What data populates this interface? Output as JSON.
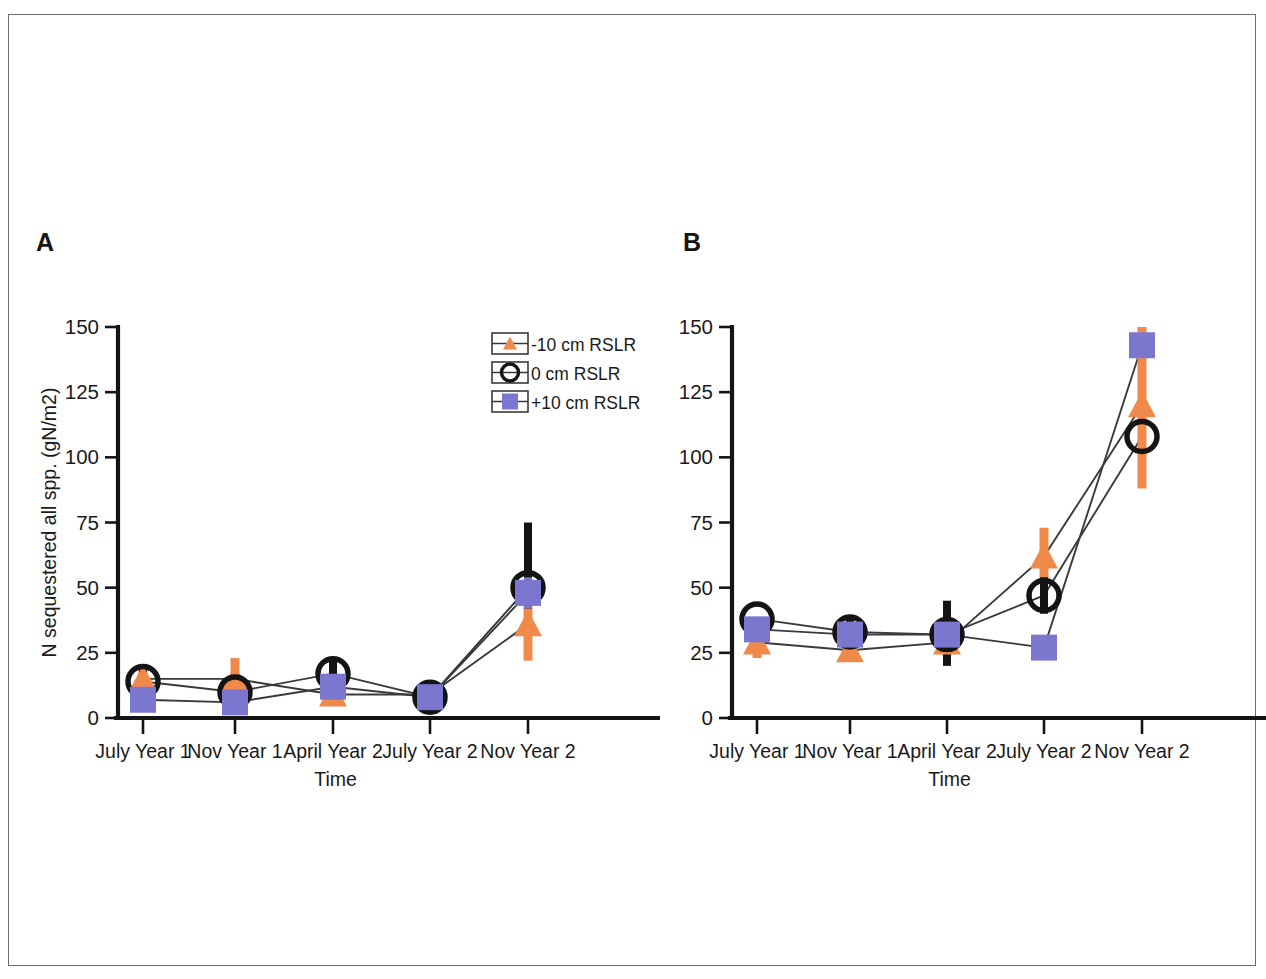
{
  "figure": {
    "panels": [
      {
        "letter": "A",
        "id": "panel-a"
      },
      {
        "letter": "B",
        "id": "panel-b"
      }
    ],
    "legend": {
      "entries": [
        {
          "label": "-10 cm RSLR",
          "marker": "triangle",
          "color": "#F08A4B"
        },
        {
          "label": "0 cm RSLR",
          "marker": "circle",
          "color": "#141414"
        },
        {
          "label": "+10 cm RSLR",
          "marker": "square",
          "color": "#7B76CE"
        }
      ]
    }
  },
  "chart_data": [
    {
      "type": "line",
      "panel": "A",
      "title": "",
      "xlabel": "Time",
      "ylabel": "N sequestered all spp. (gN/m2)",
      "categories": [
        "July Year 1",
        "Nov Year 1",
        "April Year 2",
        "July Year 2",
        "Nov Year 2"
      ],
      "yticks": [
        0,
        25,
        50,
        75,
        100,
        125,
        150
      ],
      "ylim": [
        0,
        150
      ],
      "grid": false,
      "legend_position": "top-right-inside",
      "series": [
        {
          "name": "-10 cm RSLR",
          "marker": "triangle",
          "color": "#F08A4B",
          "values": [
            15,
            15,
            9,
            9,
            36
          ],
          "err_low": [
            4,
            7,
            3,
            2,
            14
          ],
          "err_high": [
            5,
            8,
            3,
            2,
            13
          ]
        },
        {
          "name": "0 cm RSLR",
          "marker": "circle",
          "color": "#141414",
          "values": [
            14,
            10,
            17,
            8,
            50
          ],
          "err_low": [
            4,
            3,
            4,
            2,
            8
          ],
          "err_high": [
            6,
            4,
            5,
            3,
            25
          ]
        },
        {
          "name": "+10 cm RSLR",
          "marker": "square",
          "color": "#7B76CE",
          "values": [
            7,
            6,
            12,
            8,
            48
          ],
          "err_low": [
            2,
            2,
            3,
            2,
            6
          ],
          "err_high": [
            3,
            3,
            3,
            2,
            6
          ]
        }
      ]
    },
    {
      "type": "line",
      "panel": "B",
      "title": "",
      "xlabel": "Time",
      "ylabel": "",
      "categories": [
        "July Year 1",
        "Nov Year 1",
        "April Year 2",
        "July Year 2",
        "Nov Year 2"
      ],
      "yticks": [
        0,
        25,
        50,
        75,
        100,
        125,
        150
      ],
      "ylim": [
        0,
        150
      ],
      "grid": false,
      "legend_position": "none",
      "series": [
        {
          "name": "-10 cm RSLR",
          "marker": "triangle",
          "color": "#F08A4B",
          "values": [
            29,
            26,
            29,
            62,
            120
          ],
          "err_low": [
            6,
            3,
            5,
            10,
            32
          ],
          "err_high": [
            7,
            3,
            4,
            11,
            30
          ]
        },
        {
          "name": "0 cm RSLR",
          "marker": "circle",
          "color": "#141414",
          "values": [
            38,
            33,
            32,
            47,
            108
          ],
          "err_low": [
            0,
            4,
            12,
            7,
            0
          ],
          "err_high": [
            0,
            5,
            13,
            7,
            0
          ]
        },
        {
          "name": "+10 cm RSLR",
          "marker": "square",
          "color": "#7B76CE",
          "values": [
            34,
            32,
            32,
            27,
            143
          ],
          "err_low": [
            0,
            0,
            0,
            0,
            0
          ],
          "err_high": [
            0,
            0,
            0,
            0,
            0
          ]
        }
      ]
    }
  ]
}
